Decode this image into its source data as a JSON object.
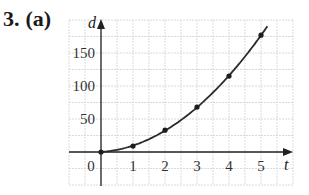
{
  "problem": {
    "number": "3.",
    "part": "(a)"
  },
  "chart_data": {
    "type": "line",
    "title": "",
    "xlabel": "t",
    "ylabel": "d",
    "x": [
      0,
      1,
      2,
      3,
      4,
      5
    ],
    "series": [
      {
        "name": "d(t)",
        "values": [
          0,
          9,
          33,
          68,
          115,
          177
        ],
        "markers": true
      }
    ],
    "x_ticks": [
      "0",
      "1",
      "2",
      "3",
      "4",
      "5"
    ],
    "y_ticks": [
      "50",
      "100",
      "150"
    ],
    "xlim": [
      -1,
      6
    ],
    "ylim": [
      -45,
      200
    ],
    "grid": true,
    "legend": "none",
    "colors": {
      "curve": "#2a2a2a",
      "grid": "#d0d0d0",
      "axis": "#222222"
    }
  }
}
